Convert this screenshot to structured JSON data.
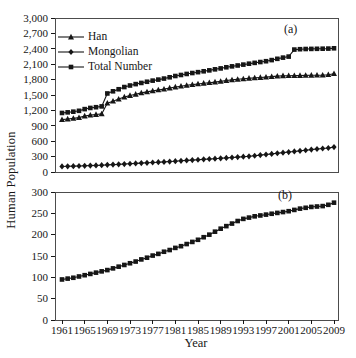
{
  "figure": {
    "y_axis_label": "Human Population",
    "x_axis_label": "Year",
    "panel_a_label": "(a)",
    "panel_b_label": "(b)",
    "background": "#ffffff",
    "line_color": "#161616",
    "frame_color": "#4c4c4c"
  },
  "years": [
    1961,
    1962,
    1963,
    1964,
    1965,
    1966,
    1967,
    1968,
    1969,
    1970,
    1971,
    1972,
    1973,
    1974,
    1975,
    1976,
    1977,
    1978,
    1979,
    1980,
    1981,
    1982,
    1983,
    1984,
    1985,
    1986,
    1987,
    1988,
    1989,
    1990,
    1991,
    1992,
    1993,
    1994,
    1995,
    1996,
    1997,
    1998,
    1999,
    2000,
    2001,
    2002,
    2003,
    2004,
    2005,
    2006,
    2007,
    2008,
    2009
  ],
  "chart_data": [
    {
      "type": "line",
      "panel": "a",
      "annotation": "(a)",
      "ylabel": "Human Population",
      "xlabel": "",
      "ylim": [
        0,
        3000
      ],
      "yticks": [
        0,
        300,
        600,
        900,
        1200,
        1500,
        1800,
        2100,
        2400,
        2700,
        3000
      ],
      "xticks": [
        1961,
        1965,
        1969,
        1973,
        1977,
        1981,
        1985,
        1989,
        1993,
        1997,
        2001,
        2005,
        2009
      ],
      "grid": false,
      "legend_position": "upper-left",
      "series": [
        {
          "name": "Han",
          "marker": "triangle",
          "values": [
            1020,
            1032,
            1045,
            1060,
            1090,
            1108,
            1120,
            1132,
            1340,
            1380,
            1420,
            1460,
            1490,
            1515,
            1540,
            1560,
            1580,
            1598,
            1615,
            1636,
            1656,
            1672,
            1688,
            1702,
            1715,
            1728,
            1740,
            1752,
            1764,
            1782,
            1794,
            1805,
            1815,
            1825,
            1833,
            1840,
            1848,
            1858,
            1868,
            1874,
            1876,
            1878,
            1880,
            1882,
            1884,
            1886,
            1888,
            1895,
            1915
          ]
        },
        {
          "name": "Mongolian",
          "marker": "diamond",
          "values": [
            108,
            111,
            114,
            117,
            121,
            125,
            129,
            133,
            139,
            144,
            149,
            155,
            161,
            167,
            173,
            179,
            185,
            191,
            197,
            204,
            211,
            218,
            225,
            232,
            239,
            246,
            253,
            260,
            267,
            274,
            282,
            290,
            298,
            306,
            317,
            329,
            341,
            353,
            365,
            377,
            389,
            400,
            412,
            424,
            436,
            448,
            458,
            468,
            485
          ]
        },
        {
          "name": "Total Number",
          "marker": "square",
          "values": [
            1150,
            1162,
            1175,
            1192,
            1225,
            1248,
            1262,
            1278,
            1530,
            1572,
            1612,
            1655,
            1685,
            1712,
            1735,
            1758,
            1780,
            1800,
            1820,
            1845,
            1870,
            1890,
            1910,
            1928,
            1945,
            1962,
            1980,
            2000,
            2018,
            2040,
            2058,
            2075,
            2092,
            2110,
            2126,
            2142,
            2158,
            2180,
            2205,
            2228,
            2248,
            2385,
            2392,
            2396,
            2398,
            2400,
            2402,
            2404,
            2410
          ]
        }
      ]
    },
    {
      "type": "line",
      "panel": "b",
      "annotation": "(b)",
      "ylabel": "Human Population",
      "xlabel": "Year",
      "ylim": [
        0,
        300
      ],
      "yticks": [
        0,
        50,
        100,
        150,
        200,
        250,
        300
      ],
      "xticks": [
        1961,
        1965,
        1969,
        1973,
        1977,
        1981,
        1985,
        1989,
        1993,
        1997,
        2001,
        2005,
        2009
      ],
      "grid": false,
      "series": [
        {
          "name": "",
          "marker": "square",
          "values": [
            95,
            97,
            99,
            102,
            105,
            108,
            111,
            114,
            117,
            121,
            125,
            129,
            133,
            137,
            142,
            146,
            151,
            155,
            160,
            164,
            169,
            173,
            178,
            183,
            188,
            194,
            200,
            207,
            214,
            220,
            226,
            232,
            237,
            240,
            243,
            245,
            247,
            249,
            251,
            253,
            255,
            258,
            261,
            263,
            265,
            266,
            267,
            270,
            275
          ]
        }
      ]
    }
  ]
}
